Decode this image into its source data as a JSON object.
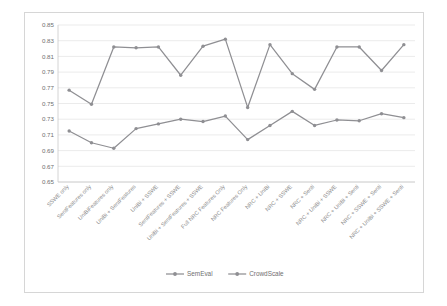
{
  "chart_data": {
    "type": "line",
    "title": "",
    "subtitle": "",
    "xlabel": "",
    "ylabel": "",
    "ylim": [
      0.65,
      0.85
    ],
    "ytick_step": 0.02,
    "ytick_labels": [
      "0.85",
      "0.83",
      "0.81",
      "0.79",
      "0.77",
      "0.75",
      "0.73",
      "0.71",
      "0.69",
      "0.67",
      "0.65"
    ],
    "grid": true,
    "legend_position": "bottom",
    "categories": [
      "SSWE only",
      "SentFeatures only",
      "UniBiFeatures only",
      "UniBi + SentFeatures",
      "UniBi + SSWE",
      "SentFeatures + SSWE",
      "UniBi + SentFeatures + SSWE",
      "Full NRC Features Only",
      "NRC Features Only",
      "NRC + UniBi",
      "NRC + SSWE",
      "NRC + Senti",
      "NRC + UniBi + SSWE",
      "NRC + UniBi + Senti",
      "NRC + SSWE + Senti",
      "NRC + UniBi + SSWE + Senti"
    ],
    "series": [
      {
        "name": "SemEval",
        "color": "#8f8f93",
        "values": [
          0.715,
          0.7,
          0.693,
          0.718,
          0.724,
          0.73,
          0.727,
          0.734,
          0.704,
          0.722,
          0.74,
          0.722,
          0.729,
          0.728,
          0.737,
          0.732
        ]
      },
      {
        "name": "CrowdScale",
        "color": "#8f8f93",
        "values": [
          0.767,
          0.749,
          0.822,
          0.821,
          0.822,
          0.786,
          0.823,
          0.832,
          0.745,
          0.825,
          0.788,
          0.768,
          0.822,
          0.822,
          0.792,
          0.825
        ]
      }
    ],
    "colors": {
      "series_line": "#8f8f93",
      "gridline": "#e2e2e2",
      "axis": "#c9c9c9",
      "tick_text": "#6f6f6f",
      "plot_background": "#ffffff",
      "card_border": "#d6d6d6"
    }
  },
  "legend": {
    "items": [
      {
        "label": "SemEval"
      },
      {
        "label": "CrowdScale"
      }
    ]
  }
}
